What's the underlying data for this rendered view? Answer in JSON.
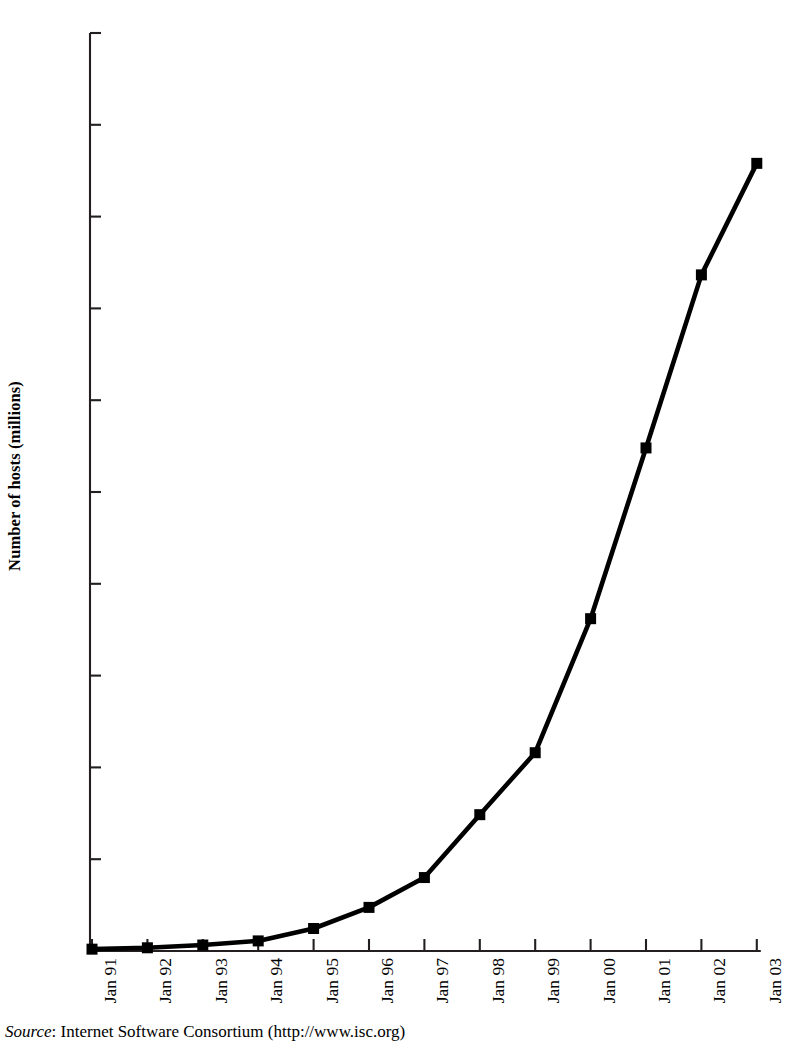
{
  "chart_data": {
    "type": "line",
    "title": "",
    "xlabel": "",
    "ylabel": "Number of hosts (millions)",
    "categories": [
      "Jan 91",
      "Jan 92",
      "Jan 93",
      "Jan 94",
      "Jan 95",
      "Jan 96",
      "Jan 97",
      "Jan 98",
      "Jan 99",
      "Jan 00",
      "Jan 01",
      "Jan 02",
      "Jan 03"
    ],
    "values": [
      0.4,
      0.7,
      1.3,
      2.2,
      4.9,
      9.5,
      16.0,
      29.7,
      43.2,
      72.4,
      109.6,
      147.3,
      171.6
    ],
    "ylim": [
      0,
      200
    ],
    "yticks": [
      0,
      20,
      40,
      60,
      80,
      100,
      120,
      140,
      160,
      180,
      200
    ],
    "ytick_labels": [
      "",
      "20",
      "40",
      "60",
      "80",
      "100",
      "120",
      "140",
      "160",
      "180",
      "200"
    ],
    "grid": false,
    "legend": false,
    "marker": "square",
    "line_color": "#000000",
    "marker_color": "#000000"
  },
  "source": {
    "label": "Source",
    "text": ": Internet Software Consortium (http://www.isc.org)"
  },
  "colors": {
    "axis": "#231f20",
    "series": "#000000",
    "background": "#ffffff"
  }
}
